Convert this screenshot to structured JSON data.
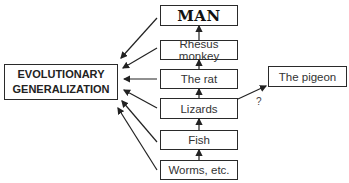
{
  "diagram": {
    "target": {
      "label_line1": "EVOLUTIONARY",
      "label_line2": "GENERALIZATION"
    },
    "chain": [
      {
        "label": "MAN"
      },
      {
        "label": "Rhesus monkey"
      },
      {
        "label": "The rat"
      },
      {
        "label": "Lizards"
      },
      {
        "label": "Fish"
      },
      {
        "label": "Worms, etc."
      }
    ],
    "side": {
      "label": "The pigeon",
      "connector_label": "?"
    }
  }
}
